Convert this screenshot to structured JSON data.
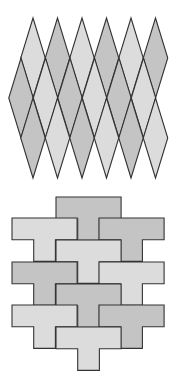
{
  "figure": {
    "width": 180,
    "height": 378,
    "background": "#ffffff"
  },
  "colors": {
    "light": "#dcdcdc",
    "dark": "#c4c4c4",
    "stroke": "#333333"
  },
  "rhombus_tiling": {
    "description": "Tiling of the plane with congruent rhombi (diamonds), alternating light and dark shades",
    "tile_width": 24.5,
    "tile_height": 80,
    "rows": [
      {
        "center_y": 58,
        "centers_x": [
          33,
          57.5,
          82,
          106.5,
          131,
          155.5
        ],
        "shades": [
          "light",
          "dark",
          "light",
          "dark",
          "light",
          "dark"
        ]
      },
      {
        "center_y": 98,
        "centers_x": [
          21,
          45.5,
          70,
          94.5,
          119,
          143.5
        ],
        "shades": [
          "dark",
          "light",
          "dark",
          "light",
          "dark",
          "light"
        ]
      },
      {
        "center_y": 138,
        "centers_x": [
          33,
          57.5,
          82,
          106.5,
          131,
          155.5
        ],
        "shades": [
          "dark",
          "light",
          "dark",
          "light",
          "dark",
          "light"
        ]
      }
    ]
  },
  "t_tiling": {
    "description": "Tiling of the plane with congruent T-shaped tiles, alternating light and dark shades",
    "unit": 21.7,
    "tiles": [
      {
        "x": 56,
        "y": 197,
        "shade": "dark"
      },
      {
        "x": 12,
        "y": 218,
        "shade": "light"
      },
      {
        "x": 99,
        "y": 218,
        "shade": "dark"
      },
      {
        "x": 56,
        "y": 240,
        "shade": "light"
      },
      {
        "x": 12,
        "y": 262,
        "shade": "dark"
      },
      {
        "x": 99,
        "y": 262,
        "shade": "light"
      },
      {
        "x": 56,
        "y": 284,
        "shade": "dark"
      },
      {
        "x": 12,
        "y": 305,
        "shade": "light"
      },
      {
        "x": 99,
        "y": 305,
        "shade": "dark"
      },
      {
        "x": 56,
        "y": 327,
        "shade": "light"
      }
    ]
  }
}
